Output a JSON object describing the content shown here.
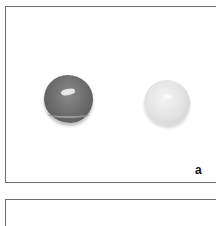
{
  "figure": {
    "panels": [
      {
        "label": "a",
        "content": "Photograph of two rounded tablets: a dark grey tablet on the left and a light grey/white tablet on the right",
        "items": [
          {
            "name": "dark-tablet",
            "color": "#6a6a6a"
          },
          {
            "name": "light-tablet",
            "color": "#e2e2e2"
          }
        ]
      },
      {
        "label": "",
        "content": "Next panel (cropped)"
      }
    ],
    "colors": {
      "border": "#6f6f6f",
      "background": "#ffffff"
    }
  }
}
